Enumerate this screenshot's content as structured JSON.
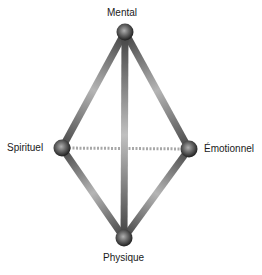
{
  "diagram": {
    "nodes": [
      {
        "id": "mental",
        "label": "Mental",
        "x": 125,
        "y": 32
      },
      {
        "id": "spirituel",
        "label": "Spirituel",
        "x": 62,
        "y": 148
      },
      {
        "id": "emotionnel",
        "label": "Émotionnel",
        "x": 189,
        "y": 149
      },
      {
        "id": "physique",
        "label": "Physique",
        "x": 124,
        "y": 238
      }
    ],
    "edges": [
      {
        "from": "mental",
        "to": "spirituel",
        "style": "solid"
      },
      {
        "from": "mental",
        "to": "emotionnel",
        "style": "solid"
      },
      {
        "from": "mental",
        "to": "physique",
        "style": "solid"
      },
      {
        "from": "spirituel",
        "to": "physique",
        "style": "solid"
      },
      {
        "from": "emotionnel",
        "to": "physique",
        "style": "solid"
      },
      {
        "from": "spirituel",
        "to": "emotionnel",
        "style": "dotted"
      }
    ],
    "colors": {
      "bar_dark": "#4a4a4a",
      "bar_light": "#b8b8b8",
      "dotted": "#a8a8a8",
      "node_dark": "#1e1e1e",
      "node_light": "#a0a0a0"
    }
  }
}
